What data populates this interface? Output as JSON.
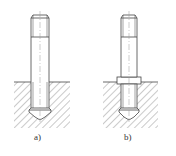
{
  "figures": [
    {
      "id": "a",
      "label": "a)",
      "variant": "stud-without-collar"
    },
    {
      "id": "b",
      "label": "b)",
      "variant": "stud-with-collar"
    }
  ],
  "colors": {
    "line": "#444444",
    "hatch": "#666666",
    "background": "#ffffff"
  }
}
